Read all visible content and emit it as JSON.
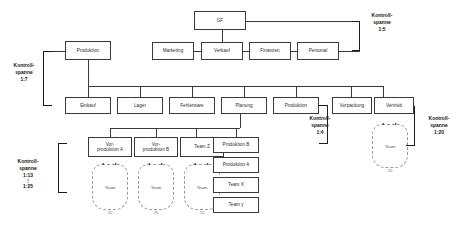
{
  "diagram": {
    "line_color": "#3a3a3a",
    "bubble_color": "#9a9a9a",
    "text_color": "#2b2b2b"
  },
  "nodes": {
    "gf": "GF",
    "produktion_top": "Produktion",
    "marketing": "Marketing",
    "verkauf": "Verkauf",
    "finanzen": "Finanzen",
    "personal": "Personal",
    "einkauf": "Einkauf",
    "lager": "Lager",
    "fehlerware": "Fehlerware",
    "planung": "Planung",
    "produktion_row3": "Produktion",
    "verpackung": "Verpackung",
    "vertrieb": "Vertrieb",
    "vorproduktion_a_l1": "Vor-",
    "vorproduktion_a_l2": "produktion A",
    "vorproduktion_b_l1": "Vor-",
    "vorproduktion_b_l2": "produktion B",
    "team_z": "Team Z",
    "produktion_b": "Produktion B",
    "produktion_a": "Produktion A",
    "team_x": "Team X",
    "team_y": "Team y"
  },
  "bubbles": {
    "team_label": "Team",
    "count_a": "20",
    "count_b": "25",
    "count_z": "13",
    "count_vertrieb": "20"
  },
  "kontrollspannen": {
    "left_7": {
      "line1": "Kontroll-",
      "line2": "spanne",
      "ratio": "1:7"
    },
    "top_right_5": {
      "line1": "Kontroll-",
      "line2": "spanne",
      "ratio": "1:5"
    },
    "mid_4": {
      "line1": "Kontroll-",
      "line2": "spanne",
      "ratio": "1:4"
    },
    "right_20": {
      "line1": "Kontroll-",
      "line2": "spanne",
      "ratio": "1:20"
    },
    "bottom_range": {
      "line1": "Kontroll-",
      "line2": "spanne",
      "ratio": "1:13",
      "dots": "⋮",
      "ratio2": "1:25"
    }
  }
}
